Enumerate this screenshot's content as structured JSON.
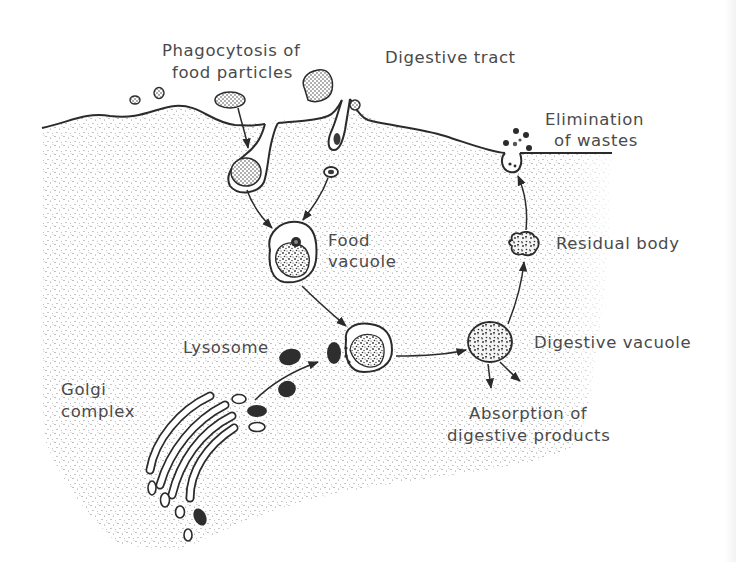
{
  "diagram": {
    "colors": {
      "background": "#ffffff",
      "cytoplasm_stipple": "#6a6a6a",
      "outline": "#2b2b2b",
      "lysosome_fill": "#2e2e2e",
      "label_text": "#4a4a4a"
    },
    "labels": {
      "phagocytosis_line1": "Phagocytosis of",
      "phagocytosis_line2": "food particles",
      "digestive_tract": "Digestive tract",
      "elimination_line1": "Elimination",
      "elimination_line2": "of wastes",
      "food_vacuole_line1": "Food",
      "food_vacuole_line2": "vacuole",
      "residual_body": "Residual body",
      "lysosome": "Lysosome",
      "digestive_vacuole": "Digestive vacuole",
      "golgi_line1": "Golgi",
      "golgi_line2": "complex",
      "absorption_line1": "Absorption of",
      "absorption_line2": "digestive products"
    },
    "nodes": [
      {
        "id": "food-particles",
        "label": "Phagocytosis of food particles"
      },
      {
        "id": "food-vacuole",
        "label": "Food vacuole"
      },
      {
        "id": "lysosome",
        "label": "Lysosome"
      },
      {
        "id": "golgi-complex",
        "label": "Golgi complex"
      },
      {
        "id": "fused-vacuole",
        "label": ""
      },
      {
        "id": "digestive-vacuole",
        "label": "Digestive vacuole"
      },
      {
        "id": "absorption",
        "label": "Absorption of digestive products"
      },
      {
        "id": "residual-body",
        "label": "Residual body"
      },
      {
        "id": "elimination",
        "label": "Elimination of wastes"
      }
    ],
    "edges": [
      {
        "from": "food-particles",
        "to": "food-vacuole"
      },
      {
        "from": "golgi-complex",
        "to": "lysosome"
      },
      {
        "from": "lysosome",
        "to": "fused-vacuole"
      },
      {
        "from": "food-vacuole",
        "to": "fused-vacuole"
      },
      {
        "from": "fused-vacuole",
        "to": "digestive-vacuole"
      },
      {
        "from": "digestive-vacuole",
        "to": "absorption"
      },
      {
        "from": "digestive-vacuole",
        "to": "residual-body"
      },
      {
        "from": "residual-body",
        "to": "elimination"
      }
    ]
  }
}
